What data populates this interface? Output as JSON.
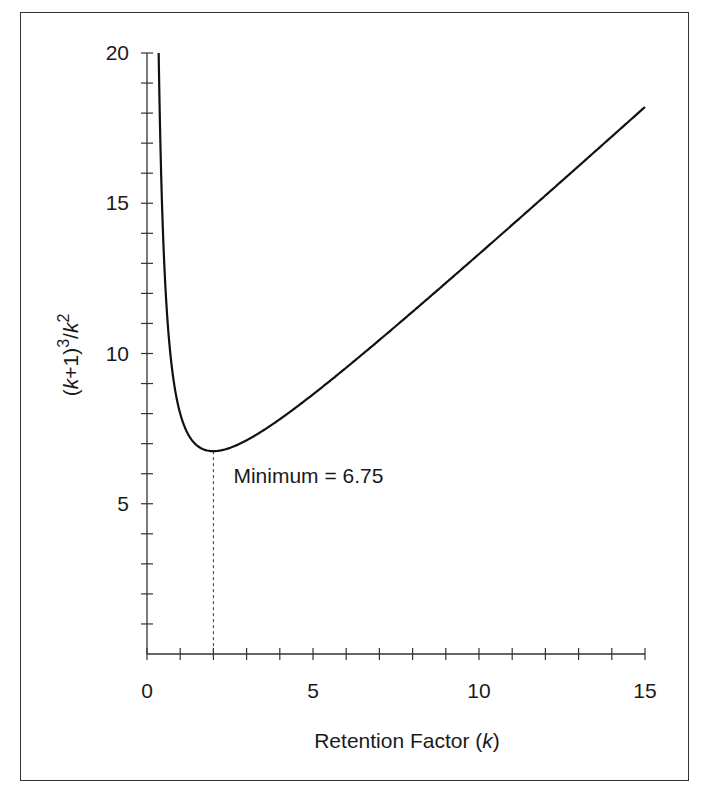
{
  "chart_data": {
    "type": "line",
    "title": "",
    "xlabel": "Retention Factor (k)",
    "xlabel_parts": {
      "prefix": "Retention Factor (",
      "var": "k",
      "suffix": ")"
    },
    "ylabel": "(k+1)^3/k^2",
    "ylabel_parts": {
      "open": "(",
      "var1": "k",
      "mid": "+1)",
      "exp1": "3",
      "slash": "/",
      "var2": "k",
      "exp2": "2"
    },
    "xlim": [
      0,
      15
    ],
    "ylim": [
      0,
      20
    ],
    "x_ticks": [
      0,
      5,
      10,
      15
    ],
    "x_tick_labels": [
      "0",
      "5",
      "10",
      "15"
    ],
    "x_minor_step": 1,
    "y_ticks": [
      5,
      10,
      15,
      20
    ],
    "y_tick_labels": [
      "5",
      "10",
      "15",
      "20"
    ],
    "y_minor_step": 1,
    "grid": false,
    "legend": null,
    "series": [
      {
        "name": "(k+1)^3/k^2",
        "formula": "(k+1)^3/k^2",
        "x": [
          0.35,
          0.4,
          0.5,
          0.6,
          0.75,
          1,
          1.25,
          1.5,
          2,
          2.5,
          3,
          4,
          5,
          6,
          8,
          10,
          12,
          15
        ],
        "values": [
          20.1,
          17.15,
          13.5,
          11.38,
          9.53,
          8.0,
          7.29,
          6.94,
          6.75,
          6.86,
          7.11,
          7.81,
          8.64,
          9.53,
          11.39,
          13.31,
          15.26,
          18.2
        ]
      }
    ],
    "annotations": [
      {
        "text": "Minimum = 6.75",
        "x": 2,
        "y": 6.75,
        "style": "dashed vertical line from minimum to x-axis"
      }
    ]
  },
  "colors": {
    "line": "#111111",
    "axis": "#333333",
    "frame": "#333333",
    "background": "#ffffff"
  }
}
